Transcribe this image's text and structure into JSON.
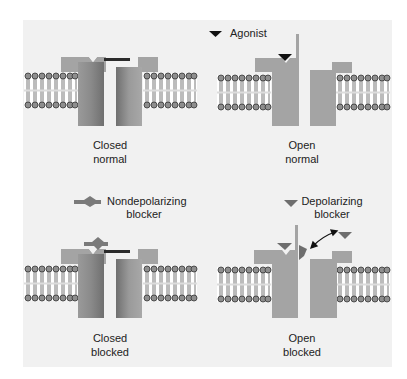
{
  "figure": {
    "panels": [
      {
        "id": "closed-normal",
        "caption_line1": "Closed",
        "caption_line2": "normal"
      },
      {
        "id": "open-normal",
        "caption_line1": "Open",
        "caption_line2": "normal"
      },
      {
        "id": "closed-blocked",
        "caption_line1": "Closed",
        "caption_line2": "blocked"
      },
      {
        "id": "open-blocked",
        "caption_line1": "Open",
        "caption_line2": "blocked"
      }
    ],
    "legend": {
      "agonist": "Agonist",
      "nondepolarizing_line1": "Nondepolarizing",
      "nondepolarizing_line2": "blocker",
      "depolarizing_line1": "Depolarizing",
      "depolarizing_line2": "blocker"
    },
    "colors": {
      "panel_bg": "#f1f1f1",
      "channel_light": "#a9a9a9",
      "channel_dark": "#7f7f7f",
      "agonist": "#111111",
      "blocker": "#6e6e6e",
      "lipid_head": "#8a8a8a"
    }
  }
}
